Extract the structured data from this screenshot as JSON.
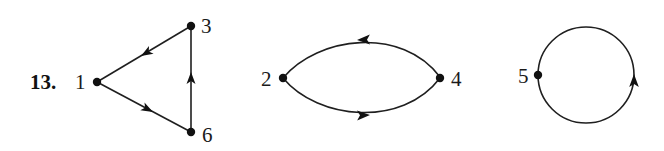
{
  "problem": {
    "number": "13."
  },
  "graphs": [
    {
      "id": "triangle",
      "nodes": [
        {
          "label": "1",
          "x": 97,
          "y": 82
        },
        {
          "label": "3",
          "x": 191,
          "y": 26
        },
        {
          "label": "6",
          "x": 191,
          "y": 132
        }
      ],
      "edges": [
        {
          "from": "3",
          "to": "1"
        },
        {
          "from": "1",
          "to": "6"
        },
        {
          "from": "6",
          "to": "3"
        }
      ]
    },
    {
      "id": "digon",
      "nodes": [
        {
          "label": "2",
          "x": 283,
          "y": 78
        },
        {
          "label": "4",
          "x": 440,
          "y": 78
        }
      ],
      "edges": [
        {
          "from": "4",
          "to": "2",
          "curve": "upper"
        },
        {
          "from": "2",
          "to": "4",
          "curve": "lower"
        }
      ]
    },
    {
      "id": "loop",
      "nodes": [
        {
          "label": "5",
          "x": 538,
          "y": 75
        }
      ],
      "edges": [
        {
          "from": "5",
          "to": "5",
          "shape": "circle",
          "direction": "counterclockwise-on-screen (up on right side)"
        }
      ]
    }
  ],
  "labels": {
    "n1": "1",
    "n2": "2",
    "n3": "3",
    "n4": "4",
    "n5": "5",
    "n6": "6"
  },
  "colors": {
    "ink": "#1f1f1f",
    "background": "#ffffff"
  }
}
